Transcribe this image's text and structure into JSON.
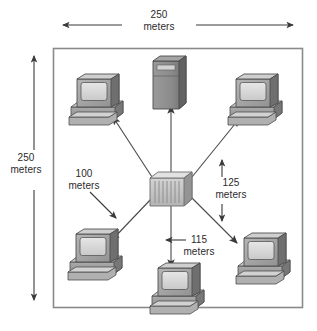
{
  "diagram": {
    "type": "network-topology",
    "unit": "meters",
    "border_color": "#808080",
    "background_color": "#ffffff",
    "text_color": "#2b2b2b",
    "device_fill": "#a8a8a8",
    "device_light": "#d0d0d0",
    "device_dark": "#6e6e6e"
  },
  "dimensions": {
    "top": {
      "value": "250",
      "unit": "meters",
      "orientation": "horizontal"
    },
    "left": {
      "value": "250",
      "unit": "meters",
      "orientation": "vertical"
    }
  },
  "distances": [
    {
      "id": "dist-100",
      "value": "100",
      "unit": "meters",
      "arrow": "diagonal-down-right"
    },
    {
      "id": "dist-125",
      "value": "125",
      "unit": "meters",
      "arrow": "vertical-double"
    },
    {
      "id": "dist-115",
      "value": "115",
      "unit": "meters",
      "arrow": "left"
    }
  ],
  "nodes": [
    {
      "id": "server-top",
      "type": "server-tower",
      "label": ""
    },
    {
      "id": "workstation-top-left",
      "type": "workstation",
      "label": ""
    },
    {
      "id": "workstation-top-right",
      "type": "workstation",
      "label": ""
    },
    {
      "id": "workstation-bottom-left",
      "type": "workstation",
      "label": ""
    },
    {
      "id": "workstation-bottom-center",
      "type": "workstation",
      "label": ""
    },
    {
      "id": "workstation-bottom-right",
      "type": "workstation",
      "label": ""
    },
    {
      "id": "hub-center",
      "type": "network-hub",
      "label": ""
    }
  ]
}
